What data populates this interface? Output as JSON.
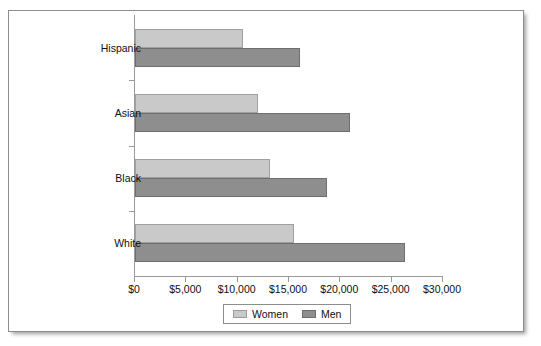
{
  "chart_data": {
    "type": "bar",
    "orientation": "horizontal",
    "title": "",
    "subtitle": "",
    "xlabel": "",
    "ylabel": "",
    "categories": [
      "Hispanic",
      "Asian",
      "Black",
      "White"
    ],
    "series": [
      {
        "name": "Women",
        "color": "#c9c9c9",
        "values": [
          10400,
          11900,
          13100,
          15400
        ]
      },
      {
        "name": "Men",
        "color": "#8e8e8e",
        "values": [
          16000,
          20800,
          18600,
          26200
        ]
      }
    ],
    "xlim": [
      0,
      30000
    ],
    "xticks": [
      0,
      5000,
      10000,
      15000,
      20000,
      25000,
      30000
    ],
    "xticklabels": [
      "$0",
      "$5,000",
      "$10,000",
      "$15,000",
      "$20,000",
      "$25,000",
      "$30,000"
    ],
    "grid": false,
    "legend": {
      "position": "bottom-center",
      "entries": [
        "Women",
        "Men"
      ]
    }
  },
  "figure": {
    "background_color": "#ffffff",
    "border_color": "#8d8d8d"
  }
}
